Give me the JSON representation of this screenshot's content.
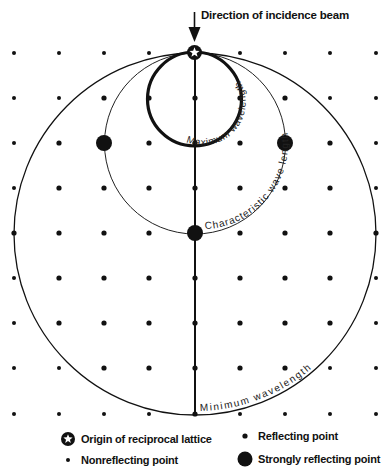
{
  "beam_label": "Direction of incidence beam",
  "arc_labels": {
    "maximum": "Maximum wavelength",
    "characteristic": "Characteristic wave length",
    "minimum": "Minimum wavelength"
  },
  "legend": {
    "origin": "Origin of reciprocal lattice",
    "nonreflecting": "Nonreflecting point",
    "reflecting": "Reflecting point",
    "strongly_reflecting": "Strongly reflecting point"
  },
  "lattice": {
    "columns_x": [
      14,
      59,
      104,
      149,
      195,
      240,
      285,
      330,
      376
    ],
    "rows_y": [
      53,
      98,
      143,
      188,
      233,
      278,
      323,
      368,
      414
    ],
    "origin": [
      195,
      53
    ],
    "strongly_reflecting": [
      [
        104,
        143
      ],
      [
        285,
        143
      ],
      [
        195,
        233
      ]
    ]
  },
  "circles": {
    "minimum_wavelength": {
      "cx": 195,
      "cy": 234,
      "r": 181
    },
    "characteristic_wavelength": {
      "cx": 195,
      "cy": 143,
      "r": 90
    },
    "maximum_wavelength": {
      "cx": 194,
      "cy": 99,
      "r": 47
    }
  },
  "colors": {
    "ink": "#111111",
    "background": "#ffffff"
  }
}
